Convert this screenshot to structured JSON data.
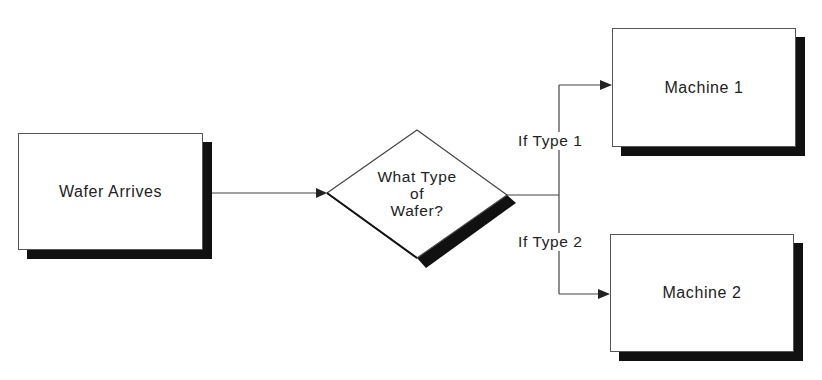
{
  "diagram": {
    "nodes": {
      "start": {
        "label": "Wafer Arrives",
        "shape": "rectangle"
      },
      "decision": {
        "label_lines": [
          "What Type",
          "of",
          "Wafer?"
        ],
        "shape": "diamond"
      },
      "machine1": {
        "label": "Machine 1",
        "shape": "rectangle"
      },
      "machine2": {
        "label": "Machine 2",
        "shape": "rectangle"
      }
    },
    "edges": [
      {
        "from": "start",
        "to": "decision",
        "label": ""
      },
      {
        "from": "decision",
        "to": "machine1",
        "label": "If Type 1"
      },
      {
        "from": "decision",
        "to": "machine2",
        "label": "If Type 2"
      }
    ],
    "colors": {
      "line": "#444444",
      "shadow": "#111111",
      "fill": "#ffffff"
    }
  }
}
